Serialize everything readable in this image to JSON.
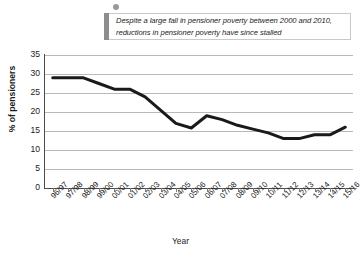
{
  "callout": {
    "text": "Despite a large fall in pensioner poverty between 2000 and 2010, reductions in pensioner poverty have since stalled",
    "accent_color": "#8d8d8d",
    "border_color": "#c9c9c9"
  },
  "chart_data": {
    "type": "line",
    "title": "",
    "xlabel": "Year",
    "ylabel": "% of pensioners",
    "ylim": [
      0,
      35
    ],
    "yticks": [
      0,
      5,
      10,
      15,
      20,
      25,
      30,
      35
    ],
    "grid": true,
    "legend": "none",
    "line_color": "#1a1a1a",
    "categories": [
      "96/97",
      "97/98",
      "98/99",
      "99/00",
      "00/01",
      "01/02",
      "02/03",
      "03/04",
      "04/05",
      "05/06",
      "06/07",
      "07/08",
      "08/09",
      "09/10",
      "10/11",
      "11/12",
      "12/13",
      "13/14",
      "14/15",
      "15/16"
    ],
    "values": [
      29,
      29,
      29,
      27.5,
      26,
      26,
      24,
      20.5,
      17,
      15.8,
      19,
      18,
      16.5,
      15.5,
      14.5,
      13,
      13,
      14,
      14,
      16
    ]
  }
}
